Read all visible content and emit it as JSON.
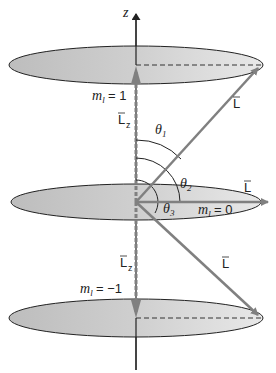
{
  "diagram": {
    "axis_label": "z",
    "vector_label": "L",
    "z_component_label": "L",
    "z_component_subscript": "z",
    "levels": [
      {
        "m_symbol": "m",
        "m_subscript": "l",
        "equals": "=",
        "value": "1"
      },
      {
        "m_symbol": "m",
        "m_subscript": "l",
        "equals": "=",
        "value": "0"
      },
      {
        "m_symbol": "m",
        "m_subscript": "l",
        "equals": "=",
        "value": "−1"
      }
    ],
    "angles": [
      {
        "symbol": "θ",
        "subscript": "1"
      },
      {
        "symbol": "θ",
        "subscript": "2"
      },
      {
        "symbol": "θ",
        "subscript": "3"
      }
    ],
    "colors": {
      "disk_fill": "#c9c9c9",
      "disk_fill_light": "#e6e6e6",
      "disk_stroke": "#222222",
      "vector": "#808080",
      "axis": "#222222"
    }
  }
}
